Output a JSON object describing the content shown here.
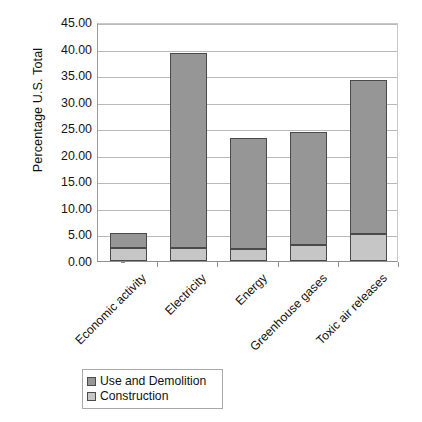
{
  "chart_data": {
    "type": "bar",
    "stacked": true,
    "title": "",
    "xlabel": "",
    "ylabel": "Percentage U.S. Total",
    "ylim": [
      0,
      45
    ],
    "ytick_step": 5,
    "ytick_labels": [
      "45.00",
      "40.00",
      "35.00",
      "30.00",
      "25.00",
      "20.00",
      "15.00",
      "10.00",
      "5.00",
      "0.00"
    ],
    "ytick_values": [
      45,
      40,
      35,
      30,
      25,
      20,
      15,
      10,
      5,
      0
    ],
    "grid": true,
    "legend_position": "bottom-left",
    "categories": [
      "Economic activity",
      "Electricity",
      "Energy",
      "Greenhouse gases",
      "Toxic air releases"
    ],
    "series": [
      {
        "name": "Construction",
        "color": "#c6c6c6",
        "values": [
          2.5,
          2.4,
          2.3,
          3.0,
          5.1
        ]
      },
      {
        "name": "Use and Demolition",
        "color": "#969696",
        "values": [
          2.8,
          36.7,
          20.9,
          21.3,
          28.9
        ]
      }
    ],
    "totals": [
      5.3,
      39.1,
      23.2,
      24.3,
      34.0
    ]
  },
  "legend": {
    "items": [
      {
        "label": "Use and Demolition",
        "swatch": "usedemo"
      },
      {
        "label": "Construction",
        "swatch": "construction"
      }
    ]
  }
}
